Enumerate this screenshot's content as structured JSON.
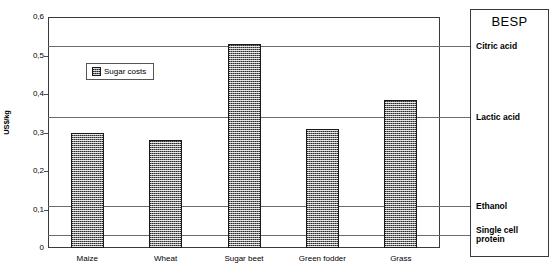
{
  "chart_data": {
    "type": "bar",
    "title": "",
    "xlabel": "",
    "ylabel": "US$/kg",
    "categories": [
      "Maize",
      "Wheat",
      "Sugar beet",
      "Green fodder",
      "Grass"
    ],
    "series": [
      {
        "name": "Sugar costs",
        "values": [
          0.3,
          0.28,
          0.53,
          0.31,
          0.385
        ]
      }
    ],
    "ylim": [
      0,
      0.6
    ],
    "yticks": [
      0,
      0.1,
      0.2,
      0.3,
      0.4,
      0.5,
      0.6
    ],
    "ytick_labels": [
      "0",
      "0,1",
      "0,2",
      "0,3",
      "0,4",
      "0,5",
      "0,6"
    ],
    "grid": false,
    "legend_position": "upper-left-inside",
    "reference_lines": [
      {
        "label": "Citric acid",
        "value": 0.525
      },
      {
        "label": "Lactic acid",
        "value": 0.34
      },
      {
        "label": "Ethanol",
        "value": 0.11
      },
      {
        "label": "Single cell protein",
        "value": 0.035
      }
    ],
    "annotations": {
      "side_panel_title": "BESP"
    }
  },
  "legend": {
    "entries": [
      {
        "label": "Sugar costs"
      }
    ]
  },
  "besp_panel": {
    "title": "BESP",
    "items": [
      {
        "label": "Citric acid"
      },
      {
        "label": "Lactic acid"
      },
      {
        "label": "Ethanol"
      },
      {
        "label": "Single cell protein"
      }
    ]
  }
}
